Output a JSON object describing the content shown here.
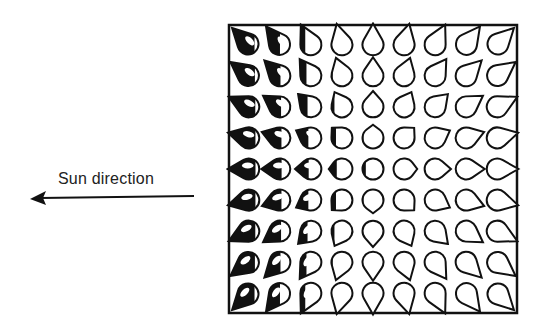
{
  "diagram": {
    "title": "",
    "sun_label": "Sun direction",
    "sun_arrow": {
      "direction": "left",
      "icon": "arrow-left-icon"
    },
    "grid": {
      "rows": 9,
      "cols": 9,
      "shape": "teardrop",
      "description": "9x9 array of teardrop shapes pointing outward toward their corners/edges (converging at grid center), shaded on the side facing the sun (left); shading increases toward the left columns",
      "ink_color": "#111111",
      "paper_color": "#ffffff"
    }
  }
}
